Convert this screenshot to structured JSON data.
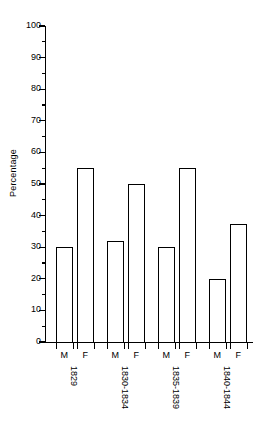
{
  "chart_data": {
    "type": "bar",
    "title": "",
    "xlabel": "",
    "ylabel": "Percentage",
    "ylim": [
      0,
      100
    ],
    "ytick_interval": 10,
    "yminor_tick_interval": 5,
    "grid": false,
    "legend": null,
    "categories": [
      "1829",
      "1830-1834",
      "1835-1839",
      "1840-1844"
    ],
    "subcategories": [
      "M",
      "F"
    ],
    "series": [
      {
        "name": "M",
        "values": [
          30,
          32,
          30,
          20
        ]
      },
      {
        "name": "F",
        "values": [
          55,
          50,
          55,
          37.5
        ]
      }
    ],
    "yticks": [
      {
        "value": 100,
        "label": "100"
      },
      {
        "value": 95,
        "label": ""
      },
      {
        "value": 90,
        "label": "90"
      },
      {
        "value": 85,
        "label": ""
      },
      {
        "value": 80,
        "label": "80"
      },
      {
        "value": 75,
        "label": ""
      },
      {
        "value": 70,
        "label": "70"
      },
      {
        "value": 65,
        "label": ""
      },
      {
        "value": 60,
        "label": "60"
      },
      {
        "value": 55,
        "label": ""
      },
      {
        "value": 50,
        "label": "50"
      },
      {
        "value": 45,
        "label": ""
      },
      {
        "value": 40,
        "label": "40"
      },
      {
        "value": 35,
        "label": ""
      },
      {
        "value": 30,
        "label": "30"
      },
      {
        "value": 25,
        "label": ""
      },
      {
        "value": 20,
        "label": "20"
      },
      {
        "value": 15,
        "label": ""
      },
      {
        "value": 10,
        "label": "10"
      },
      {
        "value": 5,
        "label": ""
      },
      {
        "value": 0,
        "label": "0"
      }
    ],
    "bars": [
      {
        "group": "1829",
        "sex": "M",
        "value": 30
      },
      {
        "group": "1829",
        "sex": "F",
        "value": 55
      },
      {
        "group": "1830-1834",
        "sex": "M",
        "value": 32
      },
      {
        "group": "1830-1834",
        "sex": "F",
        "value": 50
      },
      {
        "group": "1835-1839",
        "sex": "M",
        "value": 30
      },
      {
        "group": "1835-1839",
        "sex": "F",
        "value": 55
      },
      {
        "group": "1840-1844",
        "sex": "M",
        "value": 20
      },
      {
        "group": "1840-1844",
        "sex": "F",
        "value": 37.5
      }
    ],
    "colors": {
      "bar_fill": "#ffffff",
      "bar_stroke": "#000000",
      "axis": "#000000",
      "text": "#000000",
      "background": "#ffffff"
    }
  }
}
